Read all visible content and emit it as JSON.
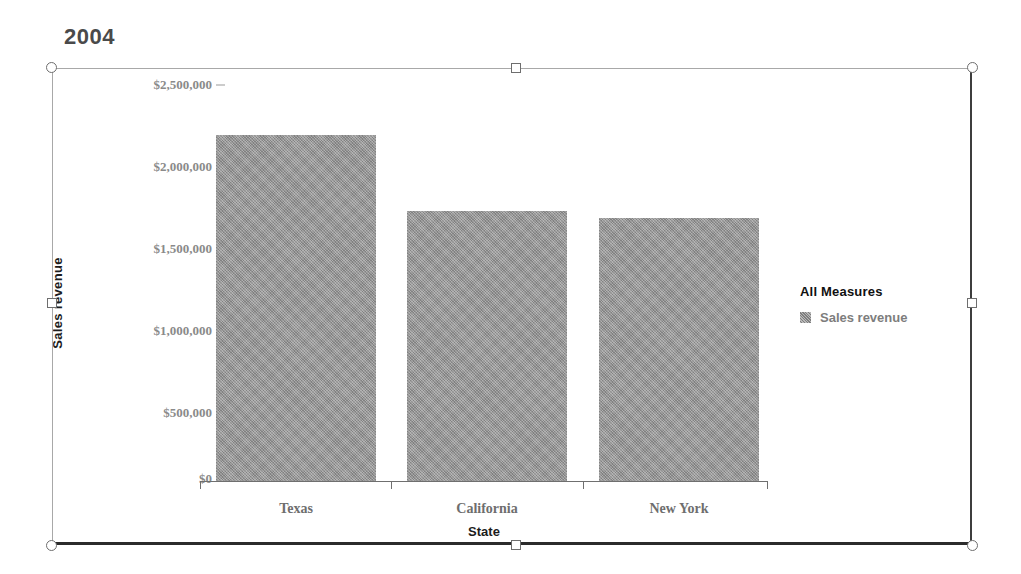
{
  "report": {
    "title": "2004"
  },
  "chart_data": {
    "type": "bar",
    "title": "2004",
    "categories": [
      "Texas",
      "California",
      "New York"
    ],
    "values": [
      2196000,
      1713000,
      1669000
    ],
    "series": [
      {
        "name": "Sales revenue",
        "values": [
          2196000,
          1713000,
          1669000
        ]
      }
    ],
    "xlabel": "State",
    "ylabel": "Sales revenue",
    "ylim": [
      0,
      2500000
    ],
    "ytick_values": [
      0,
      500000,
      1000000,
      1500000,
      2000000,
      2500000
    ],
    "ytick_labels": [
      "$0",
      "$500,000",
      "$1,000,000",
      "$1,500,000",
      "$2,000,000",
      "$2,500,000"
    ],
    "grid": false,
    "legend_position": "right",
    "legend_title": "All Measures",
    "bar_color": "#9b9b9b"
  },
  "legend": {
    "title": "All Measures",
    "items": [
      {
        "label": "Sales revenue",
        "swatch": "#9b9b9b"
      }
    ]
  },
  "axes": {
    "x_title": "State",
    "y_title": "Sales revenue",
    "x_labels": [
      "Texas",
      "California",
      "New York"
    ],
    "y_labels": [
      "$2,500,000",
      "$2,000,000",
      "$1,500,000",
      "$1,000,000",
      "$500,000",
      "$0"
    ]
  },
  "selection": {
    "handles": [
      "top-left",
      "top-center",
      "top-right",
      "middle-left",
      "middle-right",
      "bottom-left",
      "bottom-center",
      "bottom-right"
    ]
  }
}
